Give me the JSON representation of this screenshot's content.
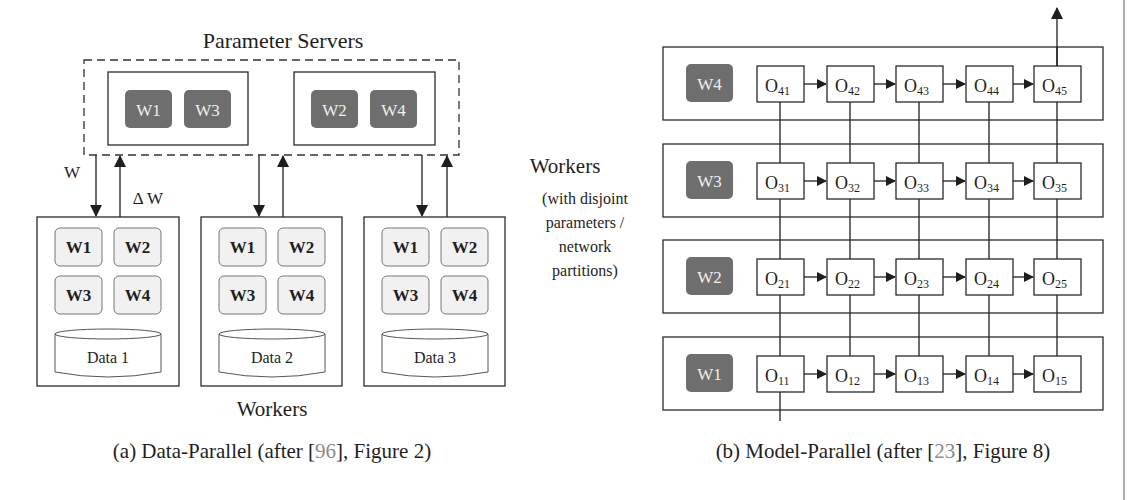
{
  "panel_a": {
    "title": "Parameter Servers",
    "server_groups": [
      {
        "chips": [
          "W1",
          "W3"
        ]
      },
      {
        "chips": [
          "W2",
          "W4"
        ]
      }
    ],
    "arrow_labels": {
      "down": "W",
      "up": "Δ W"
    },
    "workers": [
      {
        "chips": [
          "W1",
          "W2",
          "W3",
          "W4"
        ],
        "data": "Data 1"
      },
      {
        "chips": [
          "W1",
          "W2",
          "W3",
          "W4"
        ],
        "data": "Data 2"
      },
      {
        "chips": [
          "W1",
          "W2",
          "W3",
          "W4"
        ],
        "data": "Data 3"
      }
    ],
    "workers_label": "Workers",
    "caption_prefix": "(a) Data-Parallel (after [",
    "caption_ref": "96",
    "caption_suffix": "], Figure 2)"
  },
  "panel_b": {
    "side_label": {
      "title": "Workers",
      "lines": [
        "(with disjoint",
        "parameters /",
        "network",
        "partitions)"
      ]
    },
    "rows": [
      {
        "worker": "W4",
        "nodes": [
          {
            "b": "O",
            "s": "41"
          },
          {
            "b": "O",
            "s": "42"
          },
          {
            "b": "O",
            "s": "43"
          },
          {
            "b": "O",
            "s": "44"
          },
          {
            "b": "O",
            "s": "45"
          }
        ]
      },
      {
        "worker": "W3",
        "nodes": [
          {
            "b": "O",
            "s": "31"
          },
          {
            "b": "O",
            "s": "32"
          },
          {
            "b": "O",
            "s": "33"
          },
          {
            "b": "O",
            "s": "34"
          },
          {
            "b": "O",
            "s": "35"
          }
        ]
      },
      {
        "worker": "W2",
        "nodes": [
          {
            "b": "O",
            "s": "21"
          },
          {
            "b": "O",
            "s": "22"
          },
          {
            "b": "O",
            "s": "23"
          },
          {
            "b": "O",
            "s": "24"
          },
          {
            "b": "O",
            "s": "25"
          }
        ]
      },
      {
        "worker": "W1",
        "nodes": [
          {
            "b": "O",
            "s": "11"
          },
          {
            "b": "O",
            "s": "12"
          },
          {
            "b": "O",
            "s": "13"
          },
          {
            "b": "O",
            "s": "14"
          },
          {
            "b": "O",
            "s": "15"
          }
        ]
      }
    ],
    "caption_prefix": "(b) Model-Parallel (after [",
    "caption_ref": "23",
    "caption_suffix": "], Figure 8)"
  },
  "colors": {
    "dark_chip": "#6e6e6e",
    "light_chip": "#f1f1f1",
    "stroke": "#2a2a2a",
    "ref_link": "#8a8a8a"
  }
}
